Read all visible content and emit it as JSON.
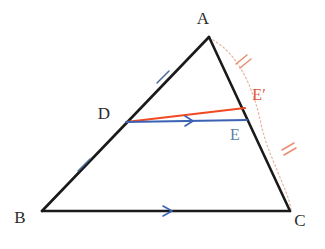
{
  "figure": {
    "kind": "geometry-diagram",
    "background_color": "#ffffff"
  },
  "colors": {
    "triangle_stroke": "#1a1a1a",
    "red_segment": "#ef4a23",
    "blue_segment": "#3c62b4",
    "dotted_arc": "#e8b9a8",
    "single_tick": "#4a6c96",
    "double_tick": "#e98d72",
    "label_dark": "#2b2b2b",
    "label_e_prime": "#e1543a",
    "label_e": "#5b7fae"
  },
  "points": {
    "A": {
      "label": "A",
      "x": 209,
      "y": 37,
      "label_x": 203,
      "label_y": 24
    },
    "B": {
      "label": "B",
      "x": 42,
      "y": 211,
      "label_x": 20,
      "label_y": 223
    },
    "C": {
      "label": "C",
      "x": 290,
      "y": 211,
      "label_x": 296,
      "label_y": 226
    },
    "D": {
      "label": "D",
      "x": 126,
      "y": 122,
      "label_x": 101,
      "label_y": 119
    },
    "E": {
      "label": "E",
      "x": 246,
      "y": 120,
      "label_x": 230,
      "label_y": 140
    },
    "E_prime": {
      "label": "E′",
      "x": 243,
      "y": 109,
      "label_x": 249,
      "label_y": 100
    }
  },
  "segments": {
    "AB": {
      "name": "AB",
      "from": "A",
      "to": "B",
      "color": "#1a1a1a",
      "style": "solid"
    },
    "BC": {
      "name": "BC",
      "from": "B",
      "to": "C",
      "color": "#1a1a1a",
      "style": "solid"
    },
    "CA": {
      "name": "CA",
      "from": "C",
      "to": "A",
      "color": "#1a1a1a",
      "style": "solid"
    },
    "DE": {
      "name": "DE",
      "from": "D",
      "to": "E",
      "color": "#3c62b4",
      "style": "solid"
    },
    "DE_prime": {
      "name": "DE′",
      "from": "D",
      "to": "E′",
      "color": "#ef4a23",
      "style": "solid"
    }
  },
  "arc": {
    "name": "arc-A-to-C",
    "from": "A",
    "to": "C",
    "style": "dotted",
    "color": "#e8b9a8",
    "bulge": "outward-right",
    "passes_through": "E′"
  },
  "marks": {
    "single_ticks": [
      {
        "name": "tick-AD",
        "on": "AD",
        "x": 163,
        "y": 77,
        "count": 1
      },
      {
        "name": "tick-DB",
        "on": "DB",
        "x": 84,
        "y": 165,
        "count": 1
      }
    ],
    "double_ticks": [
      {
        "name": "tick-arc-upper",
        "on": "arc-A-E′",
        "x": 242,
        "y": 60,
        "count": 2
      },
      {
        "name": "tick-arc-lower",
        "on": "arc-E′-C",
        "x": 288,
        "y": 148,
        "count": 2
      }
    ],
    "parallel_arrows": [
      {
        "name": "arrow-DE",
        "on": "DE",
        "x": 190,
        "y": 121,
        "count": 1
      },
      {
        "name": "arrow-BC",
        "on": "BC",
        "x": 168,
        "y": 211,
        "count": 1
      }
    ]
  }
}
